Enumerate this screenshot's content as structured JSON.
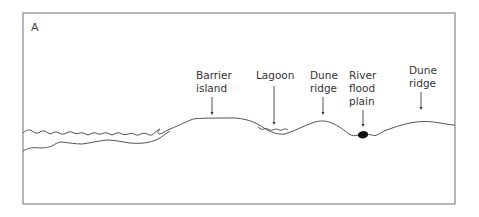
{
  "figure": {
    "panel_label": "A",
    "labels": [
      {
        "id": "barrier-island",
        "lines": [
          "Barrier",
          "island"
        ]
      },
      {
        "id": "lagoon",
        "lines": [
          "Lagoon"
        ]
      },
      {
        "id": "dune-ridge-1",
        "lines": [
          "Dune",
          "ridge"
        ]
      },
      {
        "id": "river-flood-plain",
        "lines": [
          "River",
          "flood",
          "plain"
        ]
      },
      {
        "id": "dune-ridge-2",
        "lines": [
          "Dune",
          "ridge"
        ]
      }
    ],
    "colors": {
      "line": "#555555",
      "frame": "#888888",
      "text": "#333333",
      "deposit": "#111111"
    }
  }
}
